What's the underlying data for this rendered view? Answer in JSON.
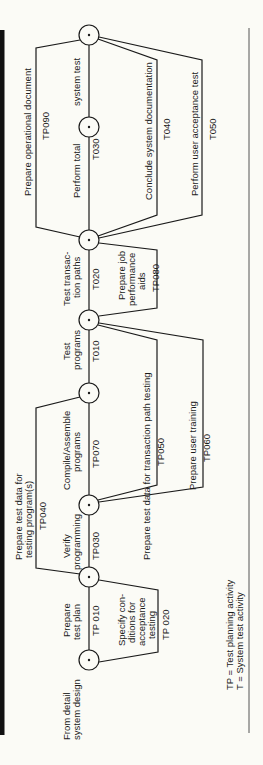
{
  "diagram": {
    "start_label": [
      "From detail",
      "system design"
    ],
    "legend": {
      "line1": "TP  =  Test planning activity",
      "line2": "T    =  System test activity"
    },
    "activities": [
      {
        "id": "TP010",
        "label": [
          "Prepare",
          "test plan"
        ],
        "code": "TP 010"
      },
      {
        "id": "TP020",
        "label": [
          "Specify con-",
          "ditions for",
          "acceptance",
          "testing"
        ],
        "code": "TP 020"
      },
      {
        "id": "TP030",
        "label": [
          "Verify",
          "programming"
        ],
        "code": "TP030"
      },
      {
        "id": "TP040",
        "label": [
          "Prepare test data for",
          "testing program(s)"
        ],
        "code": "TP040"
      },
      {
        "id": "TP070",
        "label": [
          "Compile/Assemble",
          "programs"
        ],
        "code": "TP070"
      },
      {
        "id": "TP050",
        "label": [
          "Prepare test data for transaction path testing"
        ],
        "code": "TP050"
      },
      {
        "id": "TP060",
        "label": [
          "Prepare user training"
        ],
        "code": "TP060"
      },
      {
        "id": "T010",
        "label": [
          "Test",
          "programs"
        ],
        "code": "T010"
      },
      {
        "id": "T020",
        "label": [
          "Test transac-",
          "tion paths"
        ],
        "code": "T020"
      },
      {
        "id": "TP080",
        "label": [
          "Prepare job",
          "performance",
          "aids"
        ],
        "code": "TP080"
      },
      {
        "id": "TP090",
        "label": [
          "Prepare operational document"
        ],
        "code": "TP090"
      },
      {
        "id": "T030",
        "label": [
          "Perform total",
          "system test"
        ],
        "code": "T030"
      },
      {
        "id": "T040",
        "label": [
          "Conclude system documentation"
        ],
        "code": "T040"
      },
      {
        "id": "T050",
        "label": [
          "Perform user acceptance test"
        ],
        "code": "T050"
      }
    ]
  }
}
